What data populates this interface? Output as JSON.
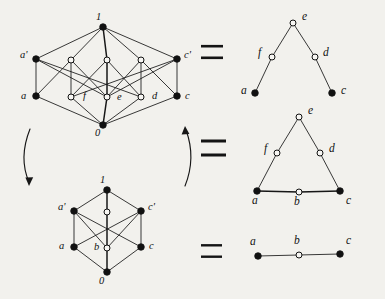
{
  "figure": {
    "background_color": "#f2f1ed",
    "ink_color": "#111111"
  },
  "panels": [
    {
      "id": "top-lattice",
      "kind": "hasse-lattice",
      "nodes": [
        {
          "id": "one_top",
          "label": "1",
          "fill": "filled",
          "x": 103,
          "y": 27,
          "lx": 96,
          "ly": 20
        },
        {
          "id": "a_prime",
          "label": "a'",
          "fill": "filled",
          "x": 36,
          "y": 59,
          "lx": 20,
          "ly": 58
        },
        {
          "id": "u1",
          "label": "",
          "fill": "open",
          "x": 71,
          "y": 60,
          "lx": 0,
          "ly": 0
        },
        {
          "id": "u2",
          "label": "",
          "fill": "open",
          "x": 107,
          "y": 60,
          "lx": 0,
          "ly": 0
        },
        {
          "id": "u3",
          "label": "",
          "fill": "open",
          "x": 141,
          "y": 60,
          "lx": 0,
          "ly": 0
        },
        {
          "id": "c_prime",
          "label": "c'",
          "fill": "filled",
          "x": 177,
          "y": 59,
          "lx": 184,
          "ly": 58
        },
        {
          "id": "a",
          "label": "a",
          "fill": "filled",
          "x": 36,
          "y": 96,
          "lx": 21,
          "ly": 99
        },
        {
          "id": "f",
          "label": "f",
          "fill": "open",
          "x": 71,
          "y": 97,
          "lx": 83,
          "ly": 99
        },
        {
          "id": "e",
          "label": "e",
          "fill": "open",
          "x": 107,
          "y": 97,
          "lx": 117,
          "ly": 100
        },
        {
          "id": "d",
          "label": "d",
          "fill": "open",
          "x": 141,
          "y": 97,
          "lx": 152,
          "ly": 99
        },
        {
          "id": "c",
          "label": "c",
          "fill": "filled",
          "x": 177,
          "y": 96,
          "lx": 185,
          "ly": 99
        },
        {
          "id": "zero_bot",
          "label": "0",
          "fill": "filled",
          "x": 103,
          "y": 125,
          "lx": 95,
          "ly": 136
        }
      ],
      "edges": [
        {
          "from": "one_top",
          "to": "a_prime",
          "weight": "thin"
        },
        {
          "from": "one_top",
          "to": "u1",
          "weight": "thin"
        },
        {
          "from": "one_top",
          "to": "u2",
          "weight": "thick"
        },
        {
          "from": "one_top",
          "to": "u3",
          "weight": "thin"
        },
        {
          "from": "one_top",
          "to": "c_prime",
          "weight": "thin"
        },
        {
          "from": "a_prime",
          "to": "a",
          "weight": "thin"
        },
        {
          "from": "a_prime",
          "to": "e",
          "weight": "thin"
        },
        {
          "from": "a_prime",
          "to": "d",
          "weight": "thin"
        },
        {
          "from": "c_prime",
          "to": "c",
          "weight": "thin"
        },
        {
          "from": "c_prime",
          "to": "e",
          "weight": "thin"
        },
        {
          "from": "c_prime",
          "to": "f",
          "weight": "thin"
        },
        {
          "from": "u1",
          "to": "a",
          "weight": "thin"
        },
        {
          "from": "u1",
          "to": "f",
          "weight": "thin"
        },
        {
          "from": "u1",
          "to": "e",
          "weight": "thin"
        },
        {
          "from": "u2",
          "to": "f",
          "weight": "thin"
        },
        {
          "from": "u2",
          "to": "e",
          "weight": "thick"
        },
        {
          "from": "u2",
          "to": "d",
          "weight": "thin"
        },
        {
          "from": "u3",
          "to": "e",
          "weight": "thin"
        },
        {
          "from": "u3",
          "to": "d",
          "weight": "thin"
        },
        {
          "from": "u3",
          "to": "c",
          "weight": "thin"
        },
        {
          "from": "a",
          "to": "zero_bot",
          "weight": "thin"
        },
        {
          "from": "f",
          "to": "zero_bot",
          "weight": "thin"
        },
        {
          "from": "e",
          "to": "zero_bot",
          "weight": "thick"
        },
        {
          "from": "d",
          "to": "zero_bot",
          "weight": "thin"
        },
        {
          "from": "c",
          "to": "zero_bot",
          "weight": "thin"
        }
      ]
    },
    {
      "id": "bottom-lattice",
      "kind": "hasse-lattice",
      "nodes": [
        {
          "id": "b1",
          "label": "1",
          "fill": "filled",
          "x": 107,
          "y": 190,
          "lx": 100,
          "ly": 183
        },
        {
          "id": "ba'",
          "label": "a'",
          "fill": "filled",
          "x": 74,
          "y": 211,
          "lx": 58,
          "ly": 210
        },
        {
          "id": "bm",
          "label": "",
          "fill": "open",
          "x": 107,
          "y": 212,
          "lx": 0,
          "ly": 0
        },
        {
          "id": "bc'",
          "label": "c'",
          "fill": "filled",
          "x": 141,
          "y": 211,
          "lx": 148,
          "ly": 210
        },
        {
          "id": "ba",
          "label": "a",
          "fill": "filled",
          "x": 74,
          "y": 247,
          "lx": 59,
          "ly": 249
        },
        {
          "id": "bb",
          "label": "b",
          "fill": "open",
          "x": 107,
          "y": 248,
          "lx": 94,
          "ly": 250
        },
        {
          "id": "bc",
          "label": "c",
          "fill": "filled",
          "x": 141,
          "y": 247,
          "lx": 149,
          "ly": 249
        },
        {
          "id": "b0",
          "label": "0",
          "fill": "filled",
          "x": 107,
          "y": 272,
          "lx": 99,
          "ly": 284
        }
      ],
      "edges": [
        {
          "from": "b1",
          "to": "ba'",
          "weight": "thin"
        },
        {
          "from": "b1",
          "to": "bm",
          "weight": "thick"
        },
        {
          "from": "b1",
          "to": "bc'",
          "weight": "thin"
        },
        {
          "from": "ba'",
          "to": "ba",
          "weight": "thin"
        },
        {
          "from": "ba'",
          "to": "bb",
          "weight": "thin"
        },
        {
          "from": "ba'",
          "to": "bc",
          "weight": "thin"
        },
        {
          "from": "bc'",
          "to": "bc",
          "weight": "thin"
        },
        {
          "from": "bc'",
          "to": "bb",
          "weight": "thin"
        },
        {
          "from": "bc'",
          "to": "ba",
          "weight": "thin"
        },
        {
          "from": "bm",
          "to": "bb",
          "weight": "thick"
        },
        {
          "from": "ba",
          "to": "b0",
          "weight": "thin"
        },
        {
          "from": "bb",
          "to": "b0",
          "weight": "thick"
        },
        {
          "from": "bc",
          "to": "b0",
          "weight": "thin"
        }
      ]
    },
    {
      "id": "quotient-top",
      "kind": "poset-tree",
      "nodes": [
        {
          "id": "qe",
          "label": "e",
          "fill": "open",
          "x": 293,
          "y": 23,
          "lx": 302,
          "ly": 20
        },
        {
          "id": "qf",
          "label": "f",
          "fill": "open",
          "x": 272,
          "y": 57,
          "lx": 258,
          "ly": 56
        },
        {
          "id": "qd",
          "label": "d",
          "fill": "open",
          "x": 315,
          "y": 57,
          "lx": 323,
          "ly": 56
        },
        {
          "id": "qa",
          "label": "a",
          "fill": "filled",
          "x": 255,
          "y": 93,
          "lx": 241,
          "ly": 94
        },
        {
          "id": "qc",
          "label": "c",
          "fill": "filled",
          "x": 332,
          "y": 93,
          "lx": 341,
          "ly": 94
        }
      ],
      "edges": [
        {
          "from": "qe",
          "to": "qf",
          "weight": "thin"
        },
        {
          "from": "qe",
          "to": "qd",
          "weight": "thin"
        },
        {
          "from": "qf",
          "to": "qa",
          "weight": "thin"
        },
        {
          "from": "qd",
          "to": "qc",
          "weight": "thin"
        }
      ]
    },
    {
      "id": "quotient-middle",
      "kind": "poset-triangle",
      "nodes": [
        {
          "id": "me",
          "label": "e",
          "fill": "open",
          "x": 299,
          "y": 117,
          "lx": 308,
          "ly": 114
        },
        {
          "id": "mf",
          "label": "f",
          "fill": "open",
          "x": 277,
          "y": 153,
          "lx": 264,
          "ly": 152
        },
        {
          "id": "md",
          "label": "d",
          "fill": "open",
          "x": 320,
          "y": 153,
          "lx": 329,
          "ly": 152
        },
        {
          "id": "ma",
          "label": "a",
          "fill": "filled",
          "x": 257,
          "y": 191,
          "lx": 252,
          "ly": 204
        },
        {
          "id": "mb",
          "label": "b",
          "fill": "open",
          "x": 299,
          "y": 192,
          "lx": 294,
          "ly": 205
        },
        {
          "id": "mc",
          "label": "c",
          "fill": "filled",
          "x": 340,
          "y": 191,
          "lx": 346,
          "ly": 204
        }
      ],
      "edges": [
        {
          "from": "me",
          "to": "mf",
          "weight": "thin"
        },
        {
          "from": "me",
          "to": "md",
          "weight": "thin"
        },
        {
          "from": "mf",
          "to": "ma",
          "weight": "thin"
        },
        {
          "from": "md",
          "to": "mc",
          "weight": "thin"
        },
        {
          "from": "ma",
          "to": "mb",
          "weight": "thick"
        },
        {
          "from": "mb",
          "to": "mc",
          "weight": "thick"
        }
      ]
    },
    {
      "id": "quotient-bottom",
      "kind": "poset-chain",
      "nodes": [
        {
          "id": "ca",
          "label": "a",
          "fill": "filled",
          "x": 258,
          "y": 256,
          "lx": 250,
          "ly": 245
        },
        {
          "id": "cb",
          "label": "b",
          "fill": "open",
          "x": 299,
          "y": 255,
          "lx": 294,
          "ly": 244
        },
        {
          "id": "cc",
          "label": "c",
          "fill": "filled",
          "x": 340,
          "y": 254,
          "lx": 346,
          "ly": 244
        }
      ],
      "edges": [
        {
          "from": "ca",
          "to": "cb",
          "weight": "thin"
        },
        {
          "from": "cb",
          "to": "cc",
          "weight": "thin"
        }
      ]
    }
  ],
  "equals_signs": [
    {
      "id": "eq-top",
      "symbol": "=",
      "x": 201,
      "y": 52,
      "width": 22,
      "gap": 9,
      "thickness": 2.6
    },
    {
      "id": "eq-middle",
      "symbol": "=",
      "x": 201,
      "y": 148,
      "width": 25,
      "gap": 11,
      "thickness": 3.0
    },
    {
      "id": "eq-bottom",
      "symbol": "=",
      "x": 201,
      "y": 251,
      "width": 21,
      "gap": 9,
      "thickness": 2.4
    }
  ],
  "arrows": [
    {
      "id": "arrow-left",
      "direction": "down",
      "path": "M 30 129 C 22 149 22 166 29 182",
      "head_points": "29,186 25.4,177.6 33.2,177.2"
    },
    {
      "id": "arrow-right",
      "direction": "up",
      "path": "M 185 186 C 193 166 193 149 186 130",
      "head_points": "185,126 181.6,134.5 189.4,134.1"
    }
  ]
}
